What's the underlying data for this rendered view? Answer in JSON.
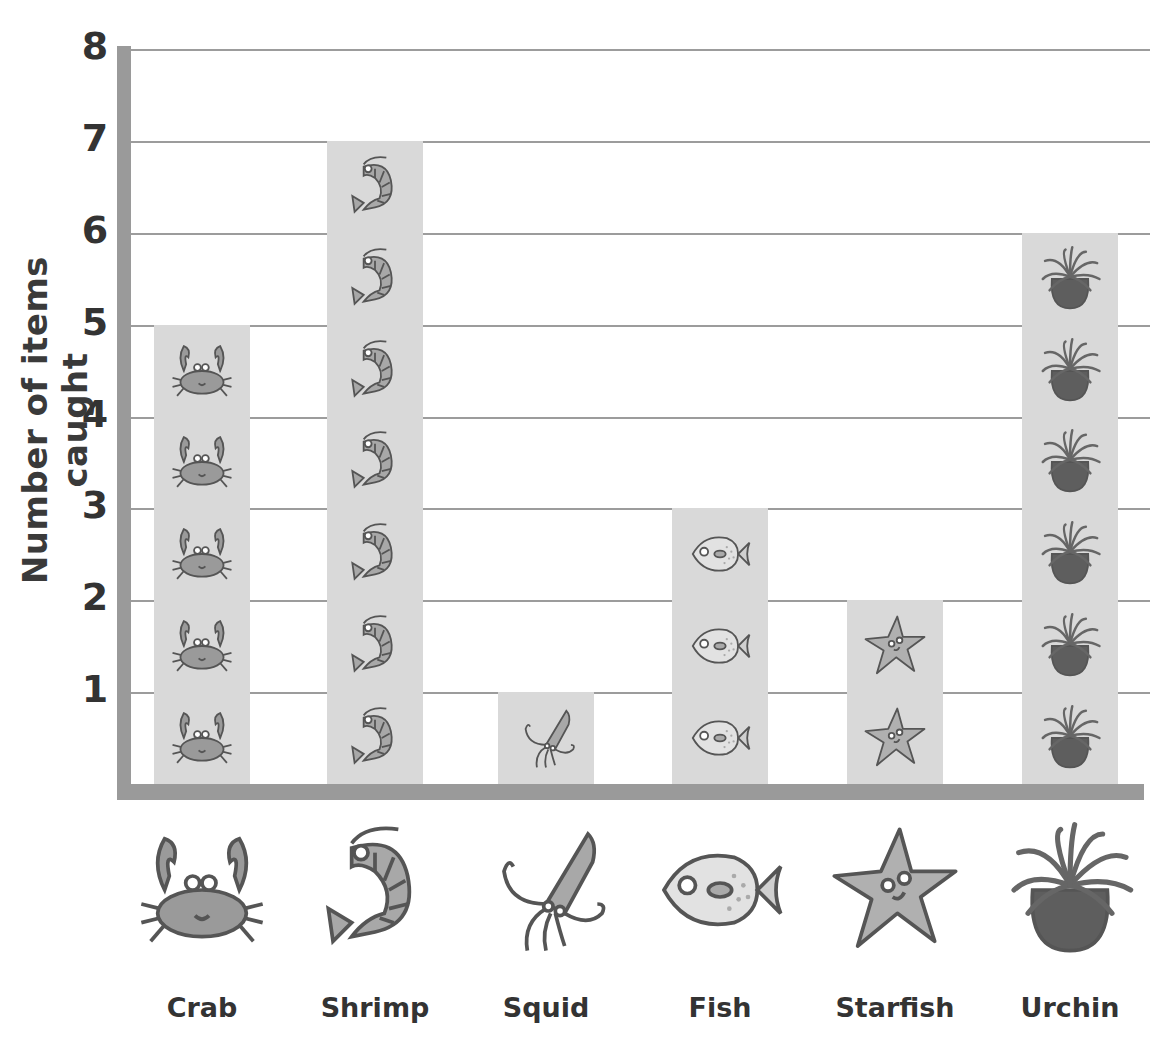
{
  "chart_data": {
    "type": "bar",
    "style": "pictogram",
    "title": "",
    "xlabel": "",
    "ylabel": "Number of items caught",
    "categories": [
      "Crab",
      "Shrimp",
      "Squid",
      "Fish",
      "Starfish",
      "Urchin"
    ],
    "values": [
      5,
      7,
      1,
      3,
      2,
      6
    ],
    "ylim": [
      0,
      8
    ],
    "yticks": [
      1,
      2,
      3,
      4,
      5,
      6,
      7,
      8
    ],
    "grid": true,
    "legend": "none",
    "icons": [
      "crab-icon",
      "shrimp-icon",
      "squid-icon",
      "fish-icon",
      "starfish-icon",
      "urchin-icon"
    ]
  },
  "colors": {
    "bar": "#d9d9d9",
    "axis": "#9a9a9a",
    "grid": "#9c9c9c",
    "text": "#333333"
  }
}
